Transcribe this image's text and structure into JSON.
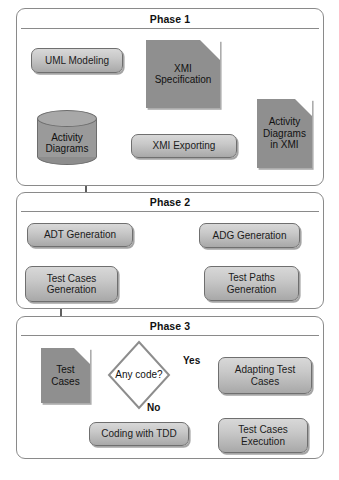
{
  "diagram": {
    "phases": [
      {
        "id": "phase1",
        "label": "Phase 1"
      },
      {
        "id": "phase2",
        "label": "Phase 2"
      },
      {
        "id": "phase3",
        "label": "Phase 3"
      }
    ],
    "nodes": {
      "uml_modeling": {
        "label": "UML Modeling",
        "shape": "process"
      },
      "activity_diagrams": {
        "line1": "Activity",
        "line2": "Diagrams",
        "shape": "cylinder"
      },
      "xmi_specification": {
        "line1": "XMI",
        "line2": "Specification",
        "shape": "document"
      },
      "xmi_exporting": {
        "label": "XMI Exporting",
        "shape": "process"
      },
      "activity_xmi": {
        "line1": "Activity",
        "line2": "Diagrams",
        "line3": "in XMI",
        "shape": "document"
      },
      "adt_generation": {
        "label": "ADT Generation",
        "shape": "process"
      },
      "adg_generation": {
        "label": "ADG Generation",
        "shape": "process"
      },
      "test_paths_gen": {
        "line1": "Test Paths",
        "line2": "Generation",
        "shape": "process"
      },
      "test_cases_gen": {
        "line1": "Test Cases",
        "line2": "Generation",
        "shape": "process"
      },
      "test_cases_doc": {
        "line1": "Test",
        "line2": "Cases",
        "shape": "document"
      },
      "any_code": {
        "label": "Any code?",
        "shape": "decision"
      },
      "adapting_test": {
        "line1": "Adapting Test",
        "line2": "Cases",
        "shape": "process"
      },
      "coding_tdd": {
        "label": "Coding with TDD",
        "shape": "process"
      },
      "test_cases_exec": {
        "line1": "Test Cases",
        "line2": "Execution",
        "shape": "process"
      }
    },
    "edge_labels": {
      "yes": "Yes",
      "no": "No"
    },
    "colors": {
      "shape_fill_dark": "#8f8f8f",
      "shape_fill_light": "#c9c9c9",
      "border": "#6f6f6f",
      "container_border": "#8a8a8a",
      "text": "#111111",
      "background": "#ffffff"
    }
  }
}
